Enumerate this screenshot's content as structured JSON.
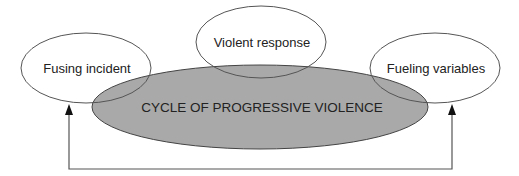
{
  "diagram": {
    "center": {
      "label": "CYCLE OF PROGRESSIVE VIOLENCE",
      "fill": "#a9a9a9"
    },
    "nodes": [
      {
        "id": "fusing-incident",
        "label": "Fusing incident"
      },
      {
        "id": "violent-response",
        "label": "Violent response"
      },
      {
        "id": "fueling-variables",
        "label": "Fueling variables"
      }
    ],
    "edges": [
      {
        "from": "fueling-variables",
        "to": "fusing-incident",
        "style": "feedback-loop",
        "arrowheads": "both-ends-up"
      }
    ],
    "colors": {
      "stroke": "#555555",
      "node_fill": "none",
      "text": "#222222",
      "background": "#ffffff"
    }
  }
}
